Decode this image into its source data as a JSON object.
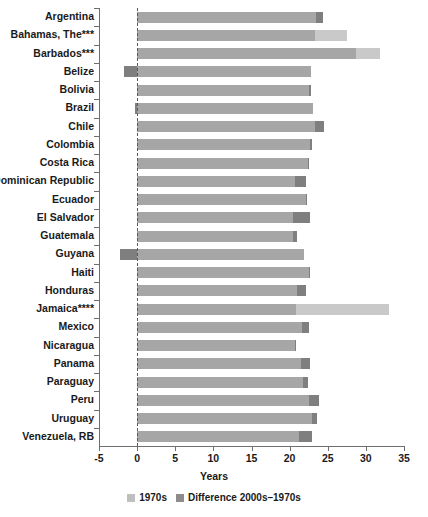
{
  "chart_data": {
    "type": "bar",
    "orientation": "horizontal",
    "stacked": true,
    "title": "",
    "xlabel": "Years",
    "ylabel": "",
    "xlim": [
      -5,
      35
    ],
    "xticks": [
      -5,
      0,
      5,
      10,
      15,
      20,
      25,
      30,
      35
    ],
    "xtick_labels": [
      "-5",
      "0",
      "5",
      "10",
      "15",
      "20",
      "25",
      "30",
      "35"
    ],
    "grid": false,
    "zero_reference_line": true,
    "legend_position": "bottom",
    "legend": [
      "1970s",
      "Difference 2000s–1970s"
    ],
    "colors": {
      "1970s": "#a6a6a6",
      "difference": "#7f7f7f",
      "difference_light": "#c9c9c9",
      "axis": "#6e6e6e",
      "text": "#1a1a1a"
    },
    "categories": [
      "Argentina",
      "Bahamas, The***",
      "Barbados***",
      "Belize",
      "Bolivia",
      "Brazil",
      "Chile",
      "Colombia",
      "Costa Rica",
      "Dominican Republic",
      "Ecuador",
      "El Salvador",
      "Guatemala",
      "Guyana",
      "Haiti",
      "Honduras",
      "Jamaica****",
      "Mexico",
      "Nicaragua",
      "Panama",
      "Paraguay",
      "Peru",
      "Uruguay",
      "Venezuela, RB"
    ],
    "series": [
      {
        "name": "1970s",
        "values": [
          23.4,
          23.3,
          28.7,
          22.8,
          22.5,
          23.0,
          23.3,
          22.7,
          22.4,
          20.7,
          22.1,
          20.4,
          20.4,
          21.9,
          22.6,
          21.0,
          20.9,
          21.6,
          20.7,
          21.5,
          21.7,
          22.5,
          22.9,
          21.2
        ]
      },
      {
        "name": "Difference 2000s–1970s",
        "values": [
          1.0,
          4.2,
          3.1,
          -1.7,
          0.3,
          -0.3,
          1.2,
          0.2,
          0.1,
          1.4,
          0.1,
          2.3,
          0.6,
          -2.2,
          0.1,
          1.2,
          12.1,
          0.9,
          0.2,
          1.2,
          0.7,
          1.3,
          0.7,
          1.7
        ]
      }
    ],
    "points": [
      {
        "category": "Argentina",
        "base": 23.4,
        "diff": 1.0,
        "diff_light": false,
        "total": 24.4
      },
      {
        "category": "Bahamas, The***",
        "base": 23.3,
        "diff": 4.2,
        "diff_light": true,
        "total": 27.5
      },
      {
        "category": "Barbados***",
        "base": 28.7,
        "diff": 3.1,
        "diff_light": true,
        "total": 31.8
      },
      {
        "category": "Belize",
        "base": 22.8,
        "diff": -1.7,
        "diff_light": false,
        "total": 21.1
      },
      {
        "category": "Bolivia",
        "base": 22.5,
        "diff": 0.3,
        "diff_light": false,
        "total": 22.8
      },
      {
        "category": "Brazil",
        "base": 23.0,
        "diff": -0.3,
        "diff_light": false,
        "total": 22.7
      },
      {
        "category": "Chile",
        "base": 23.3,
        "diff": 1.2,
        "diff_light": false,
        "total": 24.5
      },
      {
        "category": "Colombia",
        "base": 22.7,
        "diff": 0.2,
        "diff_light": false,
        "total": 22.9
      },
      {
        "category": "Costa Rica",
        "base": 22.4,
        "diff": 0.1,
        "diff_light": false,
        "total": 22.5
      },
      {
        "category": "Dominican Republic",
        "base": 20.7,
        "diff": 1.4,
        "diff_light": false,
        "total": 22.1
      },
      {
        "category": "Ecuador",
        "base": 22.1,
        "diff": 0.1,
        "diff_light": false,
        "total": 22.2
      },
      {
        "category": "El Salvador",
        "base": 20.4,
        "diff": 2.3,
        "diff_light": false,
        "total": 22.7
      },
      {
        "category": "Guatemala",
        "base": 20.4,
        "diff": 0.6,
        "diff_light": false,
        "total": 21.0
      },
      {
        "category": "Guyana",
        "base": 21.9,
        "diff": -2.2,
        "diff_light": false,
        "total": 19.7
      },
      {
        "category": "Haiti",
        "base": 22.6,
        "diff": 0.1,
        "diff_light": false,
        "total": 22.7
      },
      {
        "category": "Honduras",
        "base": 21.0,
        "diff": 1.2,
        "diff_light": false,
        "total": 22.2
      },
      {
        "category": "Jamaica****",
        "base": 20.9,
        "diff": 12.1,
        "diff_light": true,
        "total": 33.0
      },
      {
        "category": "Mexico",
        "base": 21.6,
        "diff": 0.9,
        "diff_light": false,
        "total": 22.5
      },
      {
        "category": "Nicaragua",
        "base": 20.7,
        "diff": 0.2,
        "diff_light": false,
        "total": 20.9
      },
      {
        "category": "Panama",
        "base": 21.5,
        "diff": 1.2,
        "diff_light": false,
        "total": 22.7
      },
      {
        "category": "Paraguay",
        "base": 21.7,
        "diff": 0.7,
        "diff_light": false,
        "total": 22.4
      },
      {
        "category": "Peru",
        "base": 22.5,
        "diff": 1.3,
        "diff_light": false,
        "total": 23.8
      },
      {
        "category": "Uruguay",
        "base": 22.9,
        "diff": 0.7,
        "diff_light": false,
        "total": 23.6
      },
      {
        "category": "Venezuela, RB",
        "base": 21.2,
        "diff": 1.7,
        "diff_light": false,
        "total": 22.9
      }
    ]
  }
}
